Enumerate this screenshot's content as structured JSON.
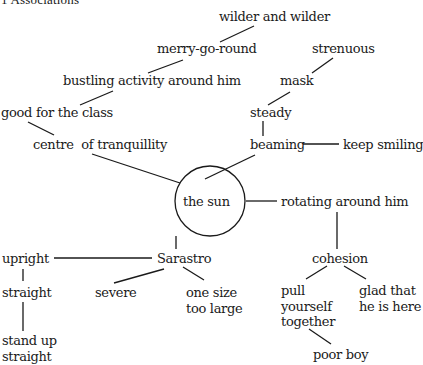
{
  "title": "1  Associations",
  "center": "the sun",
  "nodes": {
    "wilder": "wilder and wilder",
    "merry": "merry-go-round",
    "strenuous": "strenuous",
    "bustling": "bustling activity around him",
    "mask": "mask",
    "good": "good for the class",
    "steady": "steady",
    "centre": "centre  of tranquillity",
    "beaming": "beaming",
    "keep": "keep smiling",
    "rotating": "rotating around him",
    "sarastro": "Sarastro",
    "upright": "upright",
    "cohesion": "cohesion",
    "straight": "straight",
    "severe": "severe",
    "onesize": [
      "one size",
      "too large"
    ],
    "pull": [
      "pull",
      "yourself",
      "together"
    ],
    "glad": [
      "glad that",
      "he is here"
    ],
    "standup": [
      "stand up",
      "straight"
    ],
    "poor": "poor boy"
  },
  "edges": [
    [
      "the sun",
      "centre of tranquillity"
    ],
    [
      "centre of tranquillity",
      "good for the class"
    ],
    [
      "good for the class",
      "bustling activity around him"
    ],
    [
      "bustling activity around him",
      "merry-go-round"
    ],
    [
      "merry-go-round",
      "wilder and wilder"
    ],
    [
      "the sun",
      "beaming"
    ],
    [
      "beaming",
      "steady"
    ],
    [
      "steady",
      "mask"
    ],
    [
      "mask",
      "strenuous"
    ],
    [
      "beaming",
      "keep smiling"
    ],
    [
      "the sun",
      "rotating around him"
    ],
    [
      "rotating around him",
      "cohesion"
    ],
    [
      "cohesion",
      "pull yourself together"
    ],
    [
      "cohesion",
      "glad that he is here"
    ],
    [
      "pull yourself together",
      "poor boy"
    ],
    [
      "the sun",
      "Sarastro"
    ],
    [
      "Sarastro",
      "upright"
    ],
    [
      "Sarastro",
      "severe"
    ],
    [
      "Sarastro",
      "one size too large"
    ],
    [
      "upright",
      "straight"
    ],
    [
      "straight",
      "stand up straight"
    ]
  ]
}
